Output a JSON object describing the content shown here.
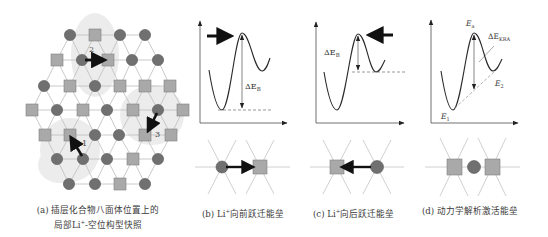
{
  "colors": {
    "li_circle": "#707070",
    "li_circle_stroke": "#555555",
    "vacancy_square": "#a9a9a9",
    "vacancy_square_stroke": "#808080",
    "lattice_line": "#bdbdbd",
    "blob": "#ececec",
    "arrow": "#111111",
    "curve": "#2a2a2a",
    "text": "#3a3a3a"
  },
  "panel_a": {
    "caption_line1": "(a) 插层化合物八面体位置上的",
    "caption_line2_pre": "局部Li",
    "caption_line2_sup": "+",
    "caption_line2_post": "-空位构型快照",
    "hop_labels": [
      "1",
      "2",
      "3"
    ],
    "rows": [
      {
        "y": 35,
        "nodes": [
          [
            "c",
            70
          ],
          [
            "s",
            95
          ],
          [
            "c",
            120
          ],
          [
            "c",
            145
          ]
        ]
      },
      {
        "y": 60,
        "nodes": [
          [
            "s",
            57
          ],
          [
            "c",
            82
          ],
          [
            "s",
            108
          ],
          [
            "c",
            132
          ],
          [
            "c",
            158
          ]
        ]
      },
      {
        "y": 86,
        "nodes": [
          [
            "c",
            44
          ],
          [
            "s",
            70
          ],
          [
            "c",
            95
          ],
          [
            "s",
            120
          ],
          [
            "s",
            145
          ],
          [
            "s",
            170
          ]
        ]
      },
      {
        "y": 110,
        "nodes": [
          [
            "s",
            32
          ],
          [
            "c",
            57
          ],
          [
            "s",
            83
          ],
          [
            "c",
            107
          ],
          [
            "s",
            133
          ],
          [
            "c",
            158
          ],
          [
            "s",
            183
          ]
        ]
      },
      {
        "y": 135,
        "nodes": [
          [
            "s",
            45
          ],
          [
            "s",
            70
          ],
          [
            "c",
            95
          ],
          [
            "c",
            119
          ],
          [
            "s",
            145
          ],
          [
            "s",
            171
          ]
        ]
      },
      {
        "y": 159,
        "nodes": [
          [
            "c",
            57
          ],
          [
            "c",
            83
          ],
          [
            "c",
            107
          ],
          [
            "s",
            133
          ],
          [
            "c",
            158
          ]
        ]
      },
      {
        "y": 184,
        "nodes": [
          [
            "c",
            69
          ],
          [
            "c",
            95
          ],
          [
            "s",
            120
          ],
          [
            "c",
            145
          ]
        ]
      }
    ]
  },
  "panel_b": {
    "caption_pre": "(b) Li",
    "caption_sup": "+",
    "caption_post": "向前跃迁能垒",
    "barrier_label": "ΔE",
    "barrier_sub": "B"
  },
  "panel_c": {
    "caption_pre": "(c) Li",
    "caption_sup": "+",
    "caption_post": "向后跃迁能垒",
    "barrier_label": "ΔE",
    "barrier_sub": "B"
  },
  "panel_d": {
    "caption": "(d) 动力学解析激活能垒",
    "ea_label": "E",
    "ea_sub": "a",
    "kra_label": "ΔE",
    "kra_sub": "KRA",
    "e1_label": "E",
    "e1_sub": "1",
    "e2_label": "E",
    "e2_sub": "2"
  }
}
